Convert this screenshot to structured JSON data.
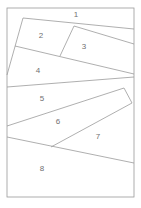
{
  "diagram": {
    "frame": {
      "x": 7,
      "y": 8,
      "w": 127,
      "h": 189
    },
    "colors": {
      "line": "#9a9a9a",
      "label": "#707070",
      "background": "#ffffff"
    },
    "regions": [
      {
        "id": "1",
        "label": "1",
        "x": 76,
        "y": 15
      },
      {
        "id": "2",
        "label": "2",
        "x": 41,
        "y": 36
      },
      {
        "id": "3",
        "label": "3",
        "x": 84,
        "y": 47
      },
      {
        "id": "4",
        "label": "4",
        "x": 38,
        "y": 71
      },
      {
        "id": "5",
        "label": "5",
        "x": 42,
        "y": 99
      },
      {
        "id": "6",
        "label": "6",
        "x": 58,
        "y": 122
      },
      {
        "id": "7",
        "label": "7",
        "x": 98,
        "y": 137
      },
      {
        "id": "8",
        "label": "8",
        "x": 42,
        "y": 169
      }
    ]
  }
}
